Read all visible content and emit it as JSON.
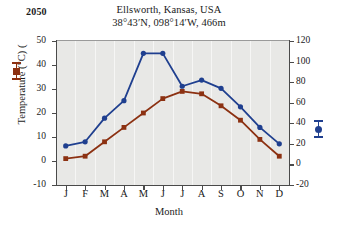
{
  "year": "2050",
  "title": {
    "location": "Ellsworth, Kansas, USA",
    "coordinates": "38°43′N, 098°14′W, 466m"
  },
  "axes": {
    "x_title": "Month",
    "y_left_title": "Temperature (°C) (",
    "y_right_title": "Precipitation (mm) (",
    "y_left_ticks": [
      "50",
      "40",
      "30",
      "20",
      "10",
      "0",
      "-10"
    ],
    "y_right_ticks": [
      "120",
      "100",
      "80",
      "60",
      "40",
      "20",
      "0",
      "-20"
    ],
    "x_ticks": [
      "J",
      "F",
      "M",
      "A",
      "M",
      "J",
      "J",
      "A",
      "S",
      "O",
      "N",
      "D"
    ]
  },
  "colors": {
    "temperature": "#8c3112",
    "precipitation": "#1f3f8f",
    "plot_background": "#e8e8e6",
    "gridline": "#f6f6f5",
    "axis": "#4a4a4a"
  },
  "legend": {
    "temperature_symbol": "square-marker",
    "precipitation_symbol": "circle-marker"
  },
  "chart_data": {
    "type": "line",
    "title": "Ellsworth, Kansas, USA",
    "subtitle": "38°43′N, 098°14′W, 466m",
    "annotation": "2050",
    "xlabel": "Month",
    "categories": [
      "J",
      "F",
      "M",
      "A",
      "M",
      "J",
      "J",
      "A",
      "S",
      "O",
      "N",
      "D"
    ],
    "grid": true,
    "legend_position": "axis-labels",
    "series": [
      {
        "name": "Temperature",
        "ylabel": "Temperature (°C)",
        "axis": "left",
        "ylim": [
          -10,
          50
        ],
        "ytick_step": 10,
        "color": "#8c3112",
        "marker": "square",
        "values": [
          1,
          2,
          8,
          14,
          20,
          26,
          29,
          28,
          23,
          17,
          9,
          2
        ]
      },
      {
        "name": "Precipitation",
        "ylabel": "Precipitation (mm)",
        "axis": "right",
        "ylim": [
          -20,
          120
        ],
        "ytick_step": 20,
        "color": "#1f3f8f",
        "marker": "circle",
        "values": [
          18,
          22,
          45,
          62,
          108,
          108,
          76,
          82,
          74,
          56,
          36,
          20
        ]
      }
    ]
  }
}
